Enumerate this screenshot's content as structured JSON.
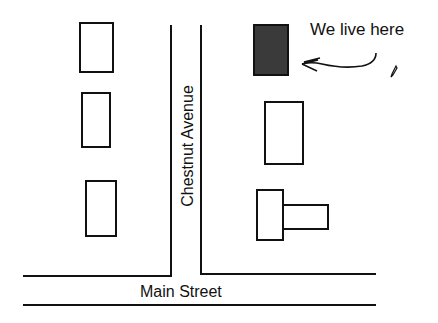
{
  "map": {
    "streets": {
      "avenue_name": "Chestnut Avenue",
      "main_street_name": "Main Street"
    },
    "annotation": {
      "text": "We live here"
    },
    "houses": [
      {
        "id": "left-1",
        "highlighted": false
      },
      {
        "id": "left-2",
        "highlighted": false
      },
      {
        "id": "left-3",
        "highlighted": false
      },
      {
        "id": "right-home",
        "highlighted": true
      },
      {
        "id": "right-2",
        "highlighted": false
      },
      {
        "id": "right-3-lshape",
        "highlighted": false
      }
    ],
    "icons": [
      "arrow-icon",
      "pencil-icon"
    ],
    "colors": {
      "line": "#111111",
      "home_fill": "#3a3a3a",
      "background": "#ffffff"
    }
  }
}
